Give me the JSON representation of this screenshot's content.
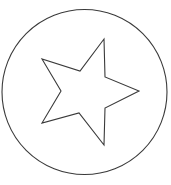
{
  "canvas": {
    "width": 171,
    "height": 185,
    "background_color": "#ffffff",
    "description": "Line drawing of a five-pointed star outline enclosed in a circle outline"
  },
  "figure": {
    "stroke_color": "#3a3a3a",
    "fill_color": "none",
    "stroke_width": 1.1
  },
  "chart_data": {
    "type": "scatter",
    "xlabel": "",
    "ylabel": "",
    "xlim": [
      0,
      171
    ],
    "ylim": [
      0,
      185
    ],
    "grid": false,
    "legend": "none",
    "shapes": [
      {
        "name": "outer-circle",
        "type": "circle",
        "cx": 84.5,
        "cy": 92,
        "r": 82.5,
        "stroke": "#3a3a3a",
        "stroke_width": 1.1,
        "fill": "none"
      },
      {
        "name": "five-pointed-star",
        "type": "polygon",
        "stroke": "#3a3a3a",
        "stroke_width": 1.1,
        "fill": "none",
        "closed": true,
        "points": [
          [
            104,
            39
          ],
          [
            105,
            77
          ],
          [
            139,
            91
          ],
          [
            105,
            108
          ],
          [
            104,
            145
          ],
          [
            79,
            113
          ],
          [
            42,
            123
          ],
          [
            61,
            91
          ],
          [
            42,
            59
          ],
          [
            80,
            71
          ]
        ],
        "point_roles": [
          "tip-top",
          "notch-upper-right",
          "tip-right",
          "notch-lower-right",
          "tip-bottom",
          "notch-lower-left",
          "tip-lower-left",
          "notch-left",
          "tip-upper-left",
          "notch-upper-left"
        ]
      }
    ]
  }
}
